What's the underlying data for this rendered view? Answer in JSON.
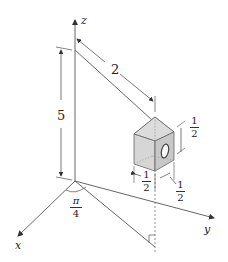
{
  "diagram": {
    "axes": {
      "x_label": "x",
      "y_label": "y",
      "z_label": "z"
    },
    "dimensions": {
      "height": "5",
      "distance": "2",
      "angle": {
        "numerator": "π",
        "denominator": "4"
      },
      "box_height": {
        "numerator": "1",
        "denominator": "2"
      },
      "box_width": {
        "numerator": "1",
        "denominator": "2"
      },
      "box_depth": {
        "numerator": "1",
        "denominator": "2"
      }
    },
    "colors": {
      "line": "#555555",
      "box_fill": "#d9d9d9",
      "box_side": "#c8c8c8",
      "roof_fill": "#e2e2e2"
    }
  }
}
